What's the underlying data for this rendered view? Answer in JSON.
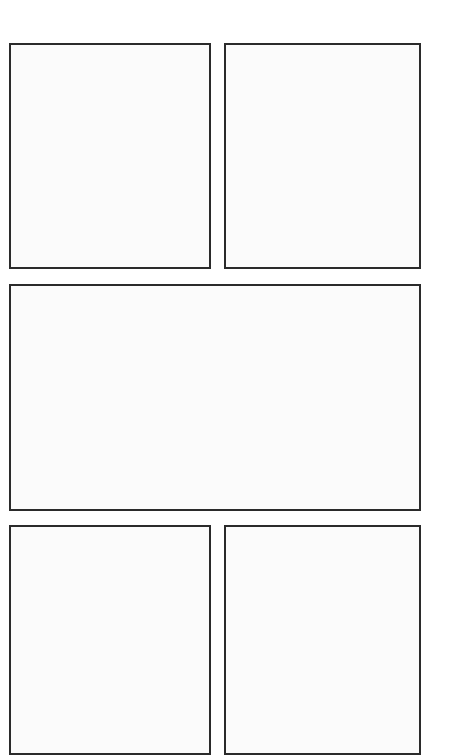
{
  "page": {
    "type": "comic-panel-template",
    "background_color": "#ffffff",
    "border_color": "#2b2b2b",
    "panel_fill": "#fbfbfb"
  },
  "panels": [
    {
      "id": "p1",
      "row": 1,
      "position": "left",
      "content": ""
    },
    {
      "id": "p2",
      "row": 1,
      "position": "right",
      "content": ""
    },
    {
      "id": "p3",
      "row": 2,
      "position": "full-width",
      "content": ""
    },
    {
      "id": "p4",
      "row": 3,
      "position": "left",
      "content": ""
    },
    {
      "id": "p5",
      "row": 3,
      "position": "right",
      "content": ""
    }
  ]
}
